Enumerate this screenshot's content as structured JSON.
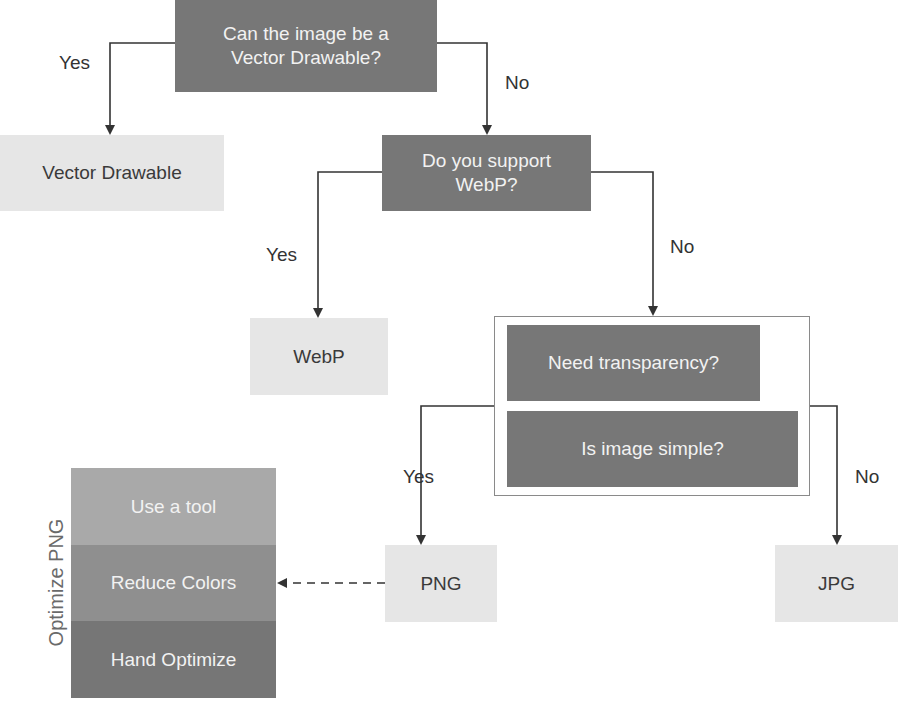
{
  "diagram": {
    "type": "decision-flowchart",
    "colors": {
      "decision_fill": "#777777",
      "decision_text": "#f2f2f2",
      "outcome_fill": "#e6e6e6",
      "outcome_text": "#3a3a3a",
      "connector": "#333333",
      "stack_top": "#a9a9a9",
      "stack_mid": "#8e8e8e",
      "stack_bottom": "#767676"
    },
    "decisions": {
      "vector": "Can the image be a Vector Drawable?",
      "webp": "Do you support WebP?",
      "transparency": "Need transparency?",
      "simple": "Is image simple?"
    },
    "outcomes": {
      "vector_drawable": "Vector Drawable",
      "webp": "WebP",
      "png": "PNG",
      "jpg": "JPG"
    },
    "edge_labels": {
      "vector_yes": "Yes",
      "vector_no": "No",
      "webp_yes": "Yes",
      "webp_no": "No",
      "group_yes": "Yes",
      "group_no": "No"
    },
    "optimize_png": {
      "title": "Optimize PNG",
      "steps": [
        {
          "label": "Use a tool"
        },
        {
          "label": "Reduce Colors"
        },
        {
          "label": "Hand Optimize"
        }
      ]
    },
    "edges": [
      {
        "from": "Can the image be a Vector Drawable?",
        "to": "Vector Drawable",
        "label": "Yes",
        "style": "solid"
      },
      {
        "from": "Can the image be a Vector Drawable?",
        "to": "Do you support WebP?",
        "label": "No",
        "style": "solid"
      },
      {
        "from": "Do you support WebP?",
        "to": "WebP",
        "label": "Yes",
        "style": "solid"
      },
      {
        "from": "Do you support WebP?",
        "to": "Need transparency? / Is image simple?",
        "label": "No",
        "style": "solid"
      },
      {
        "from": "Need transparency? / Is image simple?",
        "to": "PNG",
        "label": "Yes",
        "style": "solid"
      },
      {
        "from": "Need transparency? / Is image simple?",
        "to": "JPG",
        "label": "No",
        "style": "solid"
      },
      {
        "from": "PNG",
        "to": "Optimize PNG",
        "label": "",
        "style": "dashed"
      }
    ]
  }
}
